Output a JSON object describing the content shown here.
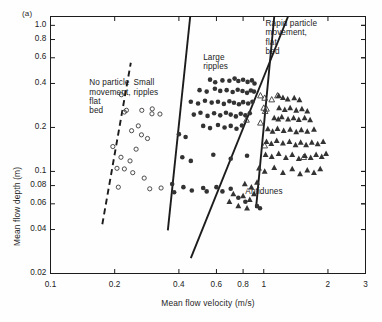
{
  "figure": {
    "panel_label": "(a)",
    "background_color": "#fefefe",
    "ink_color": "#1c1c1c"
  },
  "chart_data": {
    "type": "scatter",
    "title": "",
    "subtitle": "",
    "xlabel": "Mean flow velocity (m/s)",
    "ylabel": "Mean flow depth (m)",
    "xscale": "log",
    "yscale": "log",
    "xlim": [
      0.1,
      3
    ],
    "ylim": [
      0.02,
      1.15
    ],
    "grid": false,
    "legend_position": "none",
    "xticks": [
      0.1,
      0.2,
      0.4,
      0.6,
      0.8,
      1,
      2,
      3
    ],
    "xtick_labels": [
      "0.1",
      "0.2",
      "0.4",
      "0.6",
      "0.8",
      "1",
      "2",
      "3"
    ],
    "yticks": [
      0.02,
      0.04,
      0.06,
      0.08,
      0.1,
      0.2,
      0.4,
      0.6,
      0.8,
      1.0
    ],
    "ytick_labels": [
      "0.02",
      "0.04",
      "0.06",
      "0.08",
      "0.1",
      "0.2",
      "0.4",
      "0.6",
      "0.8",
      "1.0"
    ],
    "annotations": [
      {
        "name": "no-particle-movement",
        "text": "No particle\nmovement,\nflat\nbed",
        "x": 0.152,
        "y": 0.4
      },
      {
        "name": "small-ripples",
        "text": "Small\nripples",
        "x": 0.245,
        "y": 0.4
      },
      {
        "name": "large-ripples",
        "text": "Large\nripples",
        "x": 0.52,
        "y": 0.6
      },
      {
        "name": "rapid-particle-movement",
        "text": "Rapid particle\nmovement,\nflat\nbed",
        "x": 1.02,
        "y": 1.02
      },
      {
        "name": "antidunes",
        "text": "Antidunes",
        "x": 0.82,
        "y": 0.072
      }
    ],
    "boundaries": [
      {
        "name": "no-movement-to-small-ripples",
        "style": "dashed",
        "x": [
          0.175,
          0.238
        ],
        "y": [
          0.0435,
          0.555
        ]
      },
      {
        "name": "small-to-large-ripples",
        "style": "solid",
        "x": [
          0.355,
          0.452
        ],
        "y": [
          0.0395,
          1.15
        ]
      },
      {
        "name": "large-ripples-to-rapid-flat-bed",
        "style": "solid",
        "x": [
          0.92,
          1.12
        ],
        "y": [
          0.056,
          1.15
        ]
      },
      {
        "name": "antidunes-boundary",
        "style": "solid",
        "x": [
          0.455,
          1.3
        ],
        "y": [
          0.0255,
          1.15
        ]
      }
    ],
    "series": [
      {
        "name": "No particle movement / small ripples (open circles)",
        "marker": "open-circle",
        "points": [
          [
            0.215,
            0.335
          ],
          [
            0.222,
            0.255
          ],
          [
            0.227,
            0.262
          ],
          [
            0.268,
            0.262
          ],
          [
            0.3,
            0.268
          ],
          [
            0.299,
            0.248
          ],
          [
            0.326,
            0.247
          ],
          [
            0.24,
            0.19
          ],
          [
            0.267,
            0.178
          ],
          [
            0.285,
            0.168
          ],
          [
            0.214,
            0.125
          ],
          [
            0.236,
            0.118
          ],
          [
            0.205,
            0.105
          ],
          [
            0.222,
            0.104
          ],
          [
            0.243,
            0.098
          ],
          [
            0.275,
            0.09
          ],
          [
            0.208,
            0.078
          ],
          [
            0.292,
            0.076
          ],
          [
            0.33,
            0.077
          ],
          [
            0.196,
            0.148
          ],
          [
            0.252,
            0.142
          ],
          [
            0.258,
            0.205
          ]
        ]
      },
      {
        "name": "Large ripples / dunes (filled circles)",
        "marker": "filled-circle",
        "points": [
          [
            0.56,
            0.425
          ],
          [
            0.592,
            0.408
          ],
          [
            0.64,
            0.42
          ],
          [
            0.69,
            0.418
          ],
          [
            0.73,
            0.432
          ],
          [
            0.76,
            0.416
          ],
          [
            0.8,
            0.424
          ],
          [
            0.84,
            0.41
          ],
          [
            0.88,
            0.42
          ],
          [
            0.905,
            0.4
          ],
          [
            0.5,
            0.36
          ],
          [
            0.54,
            0.352
          ],
          [
            0.59,
            0.368
          ],
          [
            0.625,
            0.356
          ],
          [
            0.67,
            0.36
          ],
          [
            0.715,
            0.35
          ],
          [
            0.755,
            0.362
          ],
          [
            0.795,
            0.355
          ],
          [
            0.835,
            0.345
          ],
          [
            0.87,
            0.358
          ],
          [
            0.9,
            0.352
          ],
          [
            0.455,
            0.3
          ],
          [
            0.492,
            0.292
          ],
          [
            0.53,
            0.305
          ],
          [
            0.57,
            0.296
          ],
          [
            0.61,
            0.3
          ],
          [
            0.65,
            0.29
          ],
          [
            0.69,
            0.302
          ],
          [
            0.725,
            0.295
          ],
          [
            0.765,
            0.288
          ],
          [
            0.8,
            0.298
          ],
          [
            0.845,
            0.292
          ],
          [
            0.885,
            0.3
          ],
          [
            0.47,
            0.245
          ],
          [
            0.505,
            0.252
          ],
          [
            0.545,
            0.24
          ],
          [
            0.585,
            0.25
          ],
          [
            0.625,
            0.242
          ],
          [
            0.665,
            0.252
          ],
          [
            0.7,
            0.245
          ],
          [
            0.74,
            0.238
          ],
          [
            0.78,
            0.248
          ],
          [
            0.82,
            0.242
          ],
          [
            0.86,
            0.25
          ],
          [
            0.52,
            0.205
          ],
          [
            0.56,
            0.198
          ],
          [
            0.61,
            0.208
          ],
          [
            0.655,
            0.2
          ],
          [
            0.7,
            0.205
          ],
          [
            0.745,
            0.196
          ],
          [
            0.79,
            0.206
          ],
          [
            0.4,
            0.18
          ],
          [
            0.43,
            0.172
          ],
          [
            0.415,
            0.125
          ],
          [
            0.455,
            0.118
          ],
          [
            0.58,
            0.13
          ],
          [
            0.7,
            0.122
          ],
          [
            0.835,
            0.128
          ],
          [
            0.372,
            0.082
          ],
          [
            0.38,
            0.072
          ],
          [
            0.42,
            0.078
          ],
          [
            0.46,
            0.074
          ],
          [
            0.52,
            0.077
          ],
          [
            0.54,
            0.073
          ],
          [
            0.6,
            0.078
          ],
          [
            0.64,
            0.073
          ],
          [
            0.7,
            0.076
          ],
          [
            0.76,
            0.066
          ],
          [
            0.82,
            0.062
          ],
          [
            0.93,
            0.058
          ],
          [
            0.96,
            0.056
          ]
        ]
      },
      {
        "name": "Transition (open triangles)",
        "marker": "open-triangle",
        "points": [
          [
            0.965,
            0.33
          ],
          [
            1.01,
            0.318
          ],
          [
            1.09,
            0.31
          ],
          [
            1.0,
            0.272
          ],
          [
            1.03,
            0.268
          ],
          [
            1.015,
            0.258
          ],
          [
            0.83,
            0.225
          ],
          [
            0.965,
            0.215
          ],
          [
            1.01,
            0.15
          ],
          [
            1.16,
            0.33
          ],
          [
            1.54,
            0.125
          ]
        ]
      },
      {
        "name": "Rapid particle movement, flat bed / antidunes (filled triangles)",
        "marker": "filled-triangle",
        "points": [
          [
            1.175,
            0.33
          ],
          [
            1.23,
            0.32
          ],
          [
            1.295,
            0.312
          ],
          [
            1.39,
            0.318
          ],
          [
            1.47,
            0.308
          ],
          [
            1.18,
            0.272
          ],
          [
            1.255,
            0.265
          ],
          [
            1.33,
            0.272
          ],
          [
            1.42,
            0.262
          ],
          [
            1.51,
            0.268
          ],
          [
            1.6,
            0.258
          ],
          [
            1.12,
            0.232
          ],
          [
            1.17,
            0.228
          ],
          [
            1.215,
            0.236
          ],
          [
            1.3,
            0.228
          ],
          [
            1.38,
            0.232
          ],
          [
            1.46,
            0.226
          ],
          [
            1.555,
            0.232
          ],
          [
            1.65,
            0.225
          ],
          [
            1.045,
            0.195
          ],
          [
            1.1,
            0.188
          ],
          [
            1.16,
            0.196
          ],
          [
            1.24,
            0.19
          ],
          [
            1.33,
            0.194
          ],
          [
            1.42,
            0.186
          ],
          [
            1.5,
            0.192
          ],
          [
            1.6,
            0.188
          ],
          [
            1.72,
            0.194
          ],
          [
            1.03,
            0.16
          ],
          [
            1.085,
            0.155
          ],
          [
            1.15,
            0.162
          ],
          [
            1.23,
            0.156
          ],
          [
            1.32,
            0.16
          ],
          [
            1.41,
            0.152
          ],
          [
            1.49,
            0.158
          ],
          [
            1.58,
            0.152
          ],
          [
            1.68,
            0.158
          ],
          [
            1.79,
            0.154
          ],
          [
            1.9,
            0.16
          ],
          [
            1.02,
            0.13
          ],
          [
            1.09,
            0.126
          ],
          [
            1.175,
            0.132
          ],
          [
            1.27,
            0.124
          ],
          [
            1.36,
            0.13
          ],
          [
            1.46,
            0.122
          ],
          [
            1.56,
            0.128
          ],
          [
            1.66,
            0.124
          ],
          [
            1.76,
            0.13
          ],
          [
            1.87,
            0.126
          ],
          [
            1.96,
            0.132
          ],
          [
            0.95,
            0.105
          ],
          [
            1.01,
            0.1
          ],
          [
            1.12,
            0.106
          ],
          [
            1.23,
            0.098
          ],
          [
            1.36,
            0.104
          ],
          [
            1.48,
            0.096
          ],
          [
            1.6,
            0.102
          ],
          [
            1.72,
            0.098
          ],
          [
            1.84,
            0.104
          ],
          [
            0.815,
            0.082
          ],
          [
            0.875,
            0.078
          ],
          [
            0.93,
            0.084
          ],
          [
            0.8,
            0.068
          ],
          [
            0.86,
            0.064
          ],
          [
            0.9,
            0.07
          ],
          [
            0.76,
            0.058
          ],
          [
            0.835,
            0.056
          ],
          [
            0.69,
            0.062
          ],
          [
            0.72,
            0.07
          ]
        ]
      }
    ]
  }
}
